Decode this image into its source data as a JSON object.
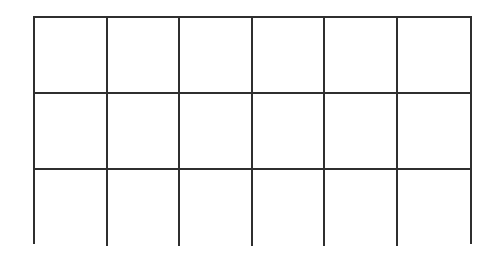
{
  "grid": {
    "rows": 3,
    "columns": 6,
    "cells": [
      [
        "",
        "",
        "",
        "",
        "",
        ""
      ],
      [
        "",
        "",
        "",
        "",
        "",
        ""
      ],
      [
        "",
        "",
        "",
        "",
        "",
        ""
      ]
    ],
    "line_color": "#2f2f2f",
    "background_color": "#ffffff"
  }
}
